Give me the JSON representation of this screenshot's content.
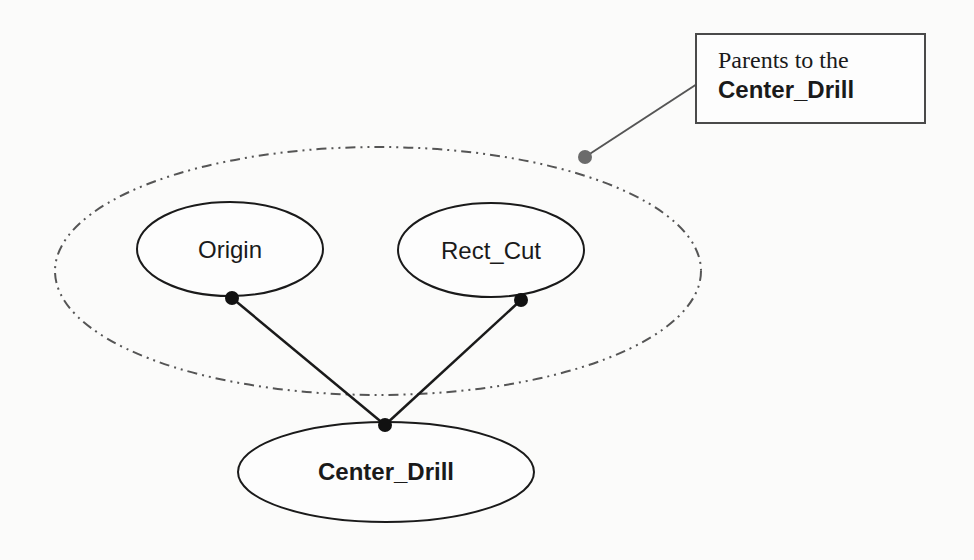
{
  "diagram": {
    "type": "parent-child dependency graph",
    "group": {
      "label": "parent-group",
      "style": "dash-dot-dot ellipse",
      "stroke_color": "#555555"
    },
    "nodes": [
      {
        "id": "origin",
        "label": "Origin",
        "bold": false,
        "role": "parent"
      },
      {
        "id": "rect_cut",
        "label": "Rect_Cut",
        "bold": false,
        "role": "parent"
      },
      {
        "id": "center_drill",
        "label": "Center_Drill",
        "bold": true,
        "role": "child"
      }
    ],
    "edges": [
      {
        "from": "origin",
        "to": "center_drill"
      },
      {
        "from": "rect_cut",
        "to": "center_drill"
      }
    ],
    "callout": {
      "line1": "Parents to the",
      "line2": "Center_Drill",
      "points_to": "parent-group"
    },
    "colors": {
      "line": "#1a1a1a",
      "dashed": "#555555",
      "callout_leader": "#555555",
      "callout_dot": "#6b6b6b",
      "background": "#fbfbfa"
    }
  }
}
